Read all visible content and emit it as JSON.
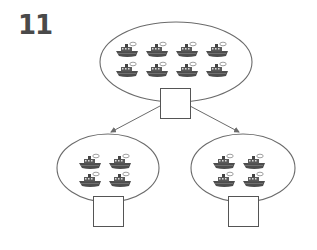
{
  "problem": {
    "number": "11",
    "description": "Part-whole diagram: 8 boats split into two groups of 4",
    "top_group": {
      "boat_count": 8,
      "rows": 2,
      "cols": 4,
      "answer": ""
    },
    "left_group": {
      "boat_count": 4,
      "rows": 2,
      "cols": 2,
      "answer": ""
    },
    "right_group": {
      "boat_count": 4,
      "rows": 2,
      "cols": 2,
      "answer": ""
    }
  },
  "icons": {
    "boat": "boat-icon",
    "arrow": "arrow-icon"
  },
  "colors": {
    "outline": "#6b6b6b",
    "boat": "#4d4d4d",
    "text": "#4a4a4a"
  }
}
